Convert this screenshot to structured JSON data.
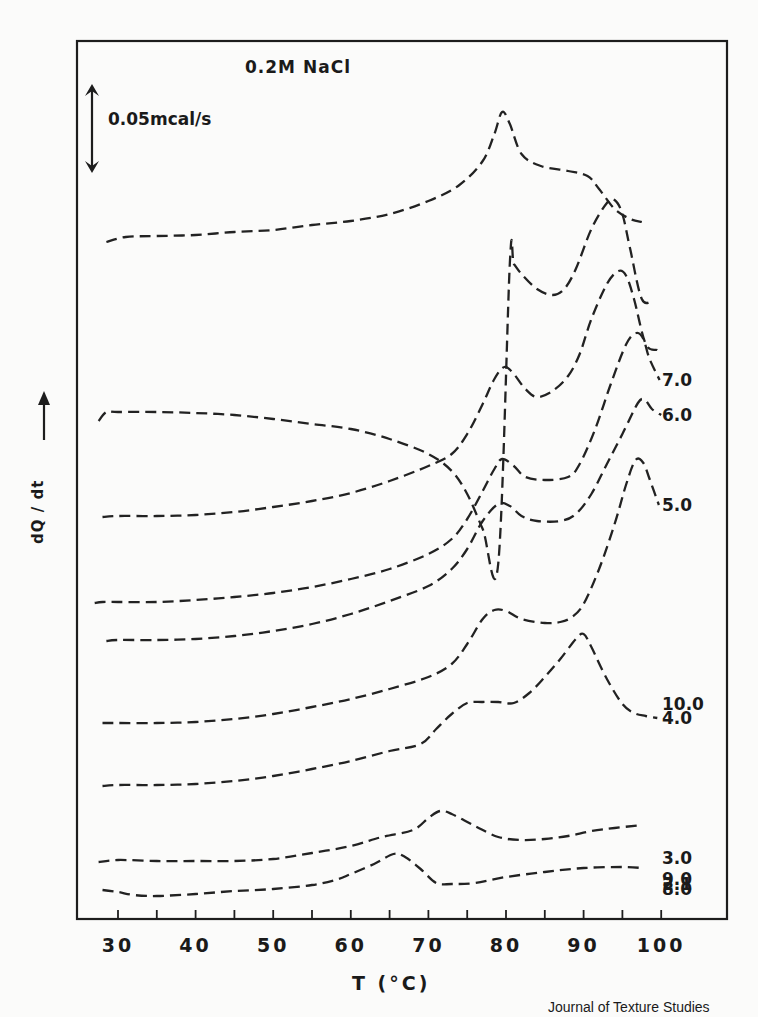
{
  "chart_data": {
    "type": "line",
    "title": "0.2M NaCl",
    "xlabel": "T (°C)",
    "ylabel": "dQ / dt",
    "ylabel_arrow": "up",
    "xlim": [
      25,
      108
    ],
    "xticks_major": [
      30,
      40,
      50,
      60,
      70,
      80,
      90,
      100
    ],
    "xticks_minor": [
      35,
      45,
      55,
      65,
      75,
      85,
      95
    ],
    "xtick_labels": [
      "30",
      "40",
      "50",
      "60",
      "70",
      "80",
      "90",
      "100"
    ],
    "grid": false,
    "legend": "inline labels at right end of each curve",
    "line_style": "dashed",
    "scale_bar": {
      "label": "0.05mcal/s",
      "units": 7.2
    },
    "y_units_note": "vertical offset units (1 unit = 10 px); curves stacked with offsets",
    "series": [
      {
        "name": "10.0",
        "label_y": 21.5,
        "points": [
          [
            28.5,
            67.7
          ],
          [
            31,
            68.2
          ],
          [
            35,
            68.3
          ],
          [
            40,
            68.4
          ],
          [
            45,
            68.7
          ],
          [
            50,
            68.9
          ],
          [
            55,
            69.4
          ],
          [
            60,
            69.8
          ],
          [
            65,
            70.5
          ],
          [
            70,
            71.8
          ],
          [
            74,
            73.4
          ],
          [
            77,
            75.8
          ],
          [
            78.5,
            78.5
          ],
          [
            79.5,
            80.7
          ],
          [
            80.5,
            79.5
          ],
          [
            82,
            76.5
          ],
          [
            84.5,
            75.3
          ],
          [
            88,
            74.8
          ],
          [
            90.5,
            74.3
          ],
          [
            92,
            73.0
          ],
          [
            94,
            71.0
          ],
          [
            96,
            70.0
          ],
          [
            97.5,
            69.7
          ]
        ]
      },
      {
        "name": "9.0",
        "label_y": 4.0,
        "points": [
          [
            27.5,
            49.8
          ],
          [
            28.5,
            50.7
          ],
          [
            30,
            50.7
          ],
          [
            35,
            50.7
          ],
          [
            40,
            50.6
          ],
          [
            45,
            50.4
          ],
          [
            50,
            50.0
          ],
          [
            55,
            49.5
          ],
          [
            60,
            49.0
          ],
          [
            65,
            48.0
          ],
          [
            70,
            46.5
          ],
          [
            73,
            44.8
          ],
          [
            75,
            42.5
          ],
          [
            77,
            39.0
          ],
          [
            79,
            35.5
          ],
          [
            80.5,
            65.7
          ],
          [
            81,
            65.5
          ],
          [
            82,
            64.5
          ],
          [
            84,
            63.0
          ],
          [
            86,
            62.4
          ],
          [
            87.5,
            63.0
          ],
          [
            89,
            65.0
          ],
          [
            91,
            69.0
          ],
          [
            93,
            71.6
          ],
          [
            94,
            71.9
          ],
          [
            95,
            70.5
          ],
          [
            96,
            67.0
          ],
          [
            97.5,
            62.0
          ],
          [
            99,
            61.9
          ]
        ]
      },
      {
        "name": "8.0",
        "label_y": 3.0,
        "points": [
          [
            28,
            40.2
          ],
          [
            30,
            40.3
          ],
          [
            35,
            40.3
          ],
          [
            40,
            40.4
          ],
          [
            45,
            40.7
          ],
          [
            50,
            41.2
          ],
          [
            55,
            41.8
          ],
          [
            60,
            42.6
          ],
          [
            65,
            43.8
          ],
          [
            70,
            45.3
          ],
          [
            73,
            46.5
          ],
          [
            75,
            48.5
          ],
          [
            77,
            51.5
          ],
          [
            78.5,
            54.0
          ],
          [
            79.8,
            55.2
          ],
          [
            81,
            54.5
          ],
          [
            82.5,
            53.0
          ],
          [
            84,
            52.2
          ],
          [
            86,
            52.8
          ],
          [
            88,
            54.3
          ],
          [
            89.5,
            56.5
          ],
          [
            91,
            60.0
          ],
          [
            93,
            63.5
          ],
          [
            94.5,
            64.8
          ],
          [
            95.5,
            64.3
          ],
          [
            96.5,
            62.0
          ],
          [
            98,
            57.5
          ],
          [
            99.5,
            56.9
          ]
        ]
      },
      {
        "name": "7.0",
        "label_y": 53.9,
        "points": [
          [
            27,
            31.6
          ],
          [
            28,
            31.7
          ],
          [
            30,
            31.7
          ],
          [
            35,
            31.7
          ],
          [
            40,
            31.9
          ],
          [
            45,
            32.2
          ],
          [
            50,
            32.6
          ],
          [
            55,
            33.2
          ],
          [
            60,
            34.0
          ],
          [
            65,
            35.0
          ],
          [
            70,
            36.5
          ],
          [
            73,
            38.0
          ],
          [
            75,
            40.0
          ],
          [
            77,
            42.8
          ],
          [
            78.5,
            45.0
          ],
          [
            79.5,
            46.0
          ],
          [
            81,
            45.3
          ],
          [
            82.5,
            44.2
          ],
          [
            85,
            43.9
          ],
          [
            88,
            44.2
          ],
          [
            89.5,
            45.5
          ],
          [
            91.5,
            49.0
          ],
          [
            93.5,
            53.5
          ],
          [
            95.5,
            57.5
          ],
          [
            96.8,
            58.6
          ],
          [
            97.7,
            58.0
          ],
          [
            98.5,
            56.0
          ],
          [
            99.8,
            53.9
          ]
        ]
      },
      {
        "name": "6.0",
        "label_y": 50.4,
        "points": [
          [
            28.5,
            27.8
          ],
          [
            30,
            27.9
          ],
          [
            35,
            27.9
          ],
          [
            40,
            28.0
          ],
          [
            45,
            28.3
          ],
          [
            50,
            28.8
          ],
          [
            55,
            29.5
          ],
          [
            60,
            30.5
          ],
          [
            65,
            31.8
          ],
          [
            70,
            33.3
          ],
          [
            73,
            35.0
          ],
          [
            75,
            37.0
          ],
          [
            77,
            39.8
          ],
          [
            79,
            41.5
          ],
          [
            80.5,
            41.3
          ],
          [
            82,
            40.3
          ],
          [
            84,
            39.8
          ],
          [
            87,
            39.8
          ],
          [
            89,
            40.5
          ],
          [
            91,
            42.5
          ],
          [
            93,
            45.5
          ],
          [
            95,
            48.5
          ],
          [
            97,
            51.6
          ],
          [
            97.9,
            51.9
          ],
          [
            98.8,
            51.0
          ],
          [
            100,
            50.4
          ]
        ]
      },
      {
        "name": "5.0",
        "label_y": 41.4,
        "points": [
          [
            28,
            19.6
          ],
          [
            30,
            19.6
          ],
          [
            35,
            19.6
          ],
          [
            40,
            19.7
          ],
          [
            45,
            20.0
          ],
          [
            50,
            20.5
          ],
          [
            55,
            21.2
          ],
          [
            60,
            22.0
          ],
          [
            65,
            23.0
          ],
          [
            70,
            24.2
          ],
          [
            73,
            25.5
          ],
          [
            75,
            27.5
          ],
          [
            77,
            30.0
          ],
          [
            78.5,
            30.9
          ],
          [
            80,
            30.8
          ],
          [
            82,
            30.0
          ],
          [
            85,
            29.6
          ],
          [
            87,
            29.7
          ],
          [
            88.5,
            30.2
          ],
          [
            90,
            31.5
          ],
          [
            92,
            35.0
          ],
          [
            94,
            39.5
          ],
          [
            95.5,
            43.5
          ],
          [
            96.7,
            45.9
          ],
          [
            97.7,
            45.6
          ],
          [
            98.5,
            44.0
          ],
          [
            99.7,
            41.4
          ]
        ]
      },
      {
        "name": "4.0",
        "label_y": 20.1,
        "points": [
          [
            28,
            13.3
          ],
          [
            30,
            13.4
          ],
          [
            35,
            13.4
          ],
          [
            40,
            13.5
          ],
          [
            45,
            13.8
          ],
          [
            50,
            14.3
          ],
          [
            55,
            15.0
          ],
          [
            60,
            15.8
          ],
          [
            65,
            16.8
          ],
          [
            69,
            17.5
          ],
          [
            71,
            19.0
          ],
          [
            73,
            20.5
          ],
          [
            75,
            21.6
          ],
          [
            77,
            21.7
          ],
          [
            79,
            21.7
          ],
          [
            81,
            21.6
          ],
          [
            83,
            22.6
          ],
          [
            85,
            24.2
          ],
          [
            87,
            26.0
          ],
          [
            89,
            28.0
          ],
          [
            90,
            28.5
          ],
          [
            91,
            27.2
          ],
          [
            93,
            24.0
          ],
          [
            95,
            21.5
          ],
          [
            96.5,
            20.6
          ],
          [
            98,
            20.3
          ],
          [
            99.5,
            20.1
          ]
        ]
      },
      {
        "name": "3.0",
        "label_y": 6.1,
        "points": [
          [
            27.5,
            5.7
          ],
          [
            30,
            5.9
          ],
          [
            35,
            5.8
          ],
          [
            40,
            5.8
          ],
          [
            45,
            5.8
          ],
          [
            50,
            6.0
          ],
          [
            55,
            6.6
          ],
          [
            60,
            7.3
          ],
          [
            64,
            8.2
          ],
          [
            68,
            8.9
          ],
          [
            70,
            10.1
          ],
          [
            71.5,
            10.8
          ],
          [
            73,
            10.5
          ],
          [
            76,
            9.3
          ],
          [
            79,
            8.2
          ],
          [
            82,
            7.9
          ],
          [
            85,
            8.0
          ],
          [
            88,
            8.3
          ],
          [
            91,
            8.8
          ],
          [
            94,
            9.1
          ],
          [
            97.5,
            9.4
          ]
        ]
      },
      {
        "name": "2.1",
        "label_y": 3.5,
        "points": [
          [
            28,
            2.9
          ],
          [
            30,
            2.7
          ],
          [
            32,
            2.4
          ],
          [
            35,
            2.3
          ],
          [
            40,
            2.5
          ],
          [
            45,
            2.8
          ],
          [
            50,
            3.0
          ],
          [
            55,
            3.4
          ],
          [
            58,
            3.9
          ],
          [
            60,
            4.5
          ],
          [
            63,
            5.5
          ],
          [
            65.5,
            6.5
          ],
          [
            67,
            6.2
          ],
          [
            69,
            5.0
          ],
          [
            71,
            3.6
          ],
          [
            73,
            3.5
          ],
          [
            76,
            3.6
          ],
          [
            80,
            4.2
          ],
          [
            85,
            4.7
          ],
          [
            90,
            5.1
          ],
          [
            95,
            5.2
          ],
          [
            97.5,
            5.1
          ]
        ]
      }
    ]
  },
  "credit": "Journal of Texture Studies"
}
